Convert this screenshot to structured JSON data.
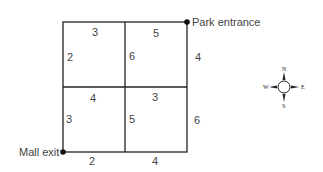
{
  "diagram": {
    "type": "street-grid-map",
    "points": {
      "start": {
        "label": "Mall exit"
      },
      "end": {
        "label": "Park entrance"
      }
    },
    "edges": {
      "top_left": "3",
      "top_right": "5",
      "middle_left": "4",
      "middle_right": "3",
      "bottom_left": "2",
      "bottom_right": "4",
      "left_upper": "2",
      "left_lower": "3",
      "center_upper": "6",
      "center_lower": "5",
      "right_upper": "4",
      "right_lower": "6"
    },
    "compass": {
      "n": "N",
      "s": "S",
      "e": "E",
      "w": "W"
    }
  }
}
